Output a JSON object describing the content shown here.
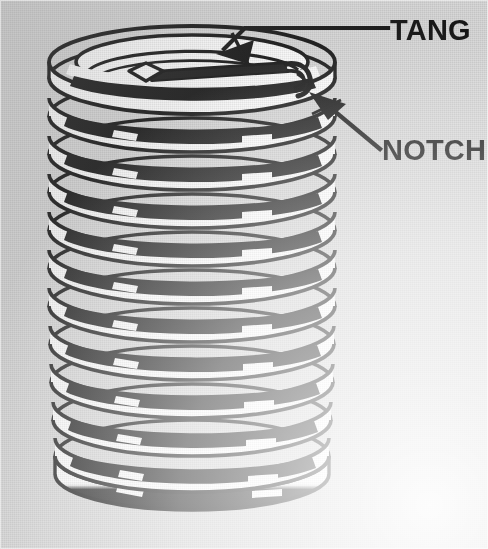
{
  "figure": {
    "background_color": "#d9d9d9",
    "ink_color": "#111111",
    "highlight_color": "#ffffff",
    "callouts": [
      {
        "id": "tang",
        "label": "TANG",
        "label_x": 386,
        "label_y": 38,
        "leader": "M386,28 L245,28 L222,50",
        "arrow_tip_x": 218,
        "arrow_tip_y": 52,
        "arrow_angle_deg": 133,
        "description": "bent driving tang at top coil"
      },
      {
        "id": "notch",
        "label": "NOTCH",
        "label_x": 382,
        "label_y": 160,
        "leader": "M380,148 L322,100",
        "arrow_tip_x": 312,
        "arrow_tip_y": 93,
        "arrow_angle_deg": 219,
        "description": "break-off notch on coil wire"
      }
    ],
    "coil": {
      "turns": 12,
      "center_x": 192,
      "top_y": 78,
      "pitch": 38,
      "radius_x": 143,
      "radius_y": 36,
      "wire_thickness": 21,
      "taper_bottom": 0.96
    }
  }
}
